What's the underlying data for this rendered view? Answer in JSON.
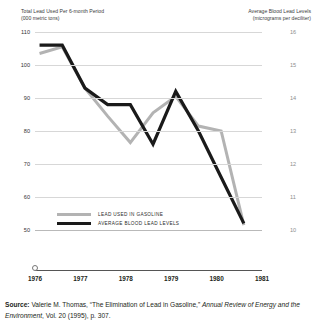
{
  "axis_titles": {
    "left": "Total Lead Used Per 6-month Period\n(000 metric tons)",
    "right": "Average Blood Lead Levels\n(micrograms per deciliter)"
  },
  "legend": {
    "gasoline": "LEAD USED IN GASOLINE",
    "blood": "AVERAGE BLOOD LEAD LEVELS"
  },
  "source": {
    "label": "Source:",
    "text_before": " Valerie M. Thomas, “The Elimination of Lead in Gasoline,” ",
    "italic": "Annual Review of Energy and the Environment",
    "text_after": ", Vol. 20 (1995), p. 307."
  },
  "colors": {
    "gasoline_line": "#b3b3b3",
    "blood_line": "#1a1a1a",
    "gridline": "#d7d7d7",
    "axis": "#555555"
  },
  "chart_data": {
    "type": "line",
    "title": "",
    "xlabel": "",
    "ylabel": "Total Lead Used Per 6-month Period (000 metric tons)",
    "y2label": "Average Blood Lead Levels (micrograms per deciliter)",
    "grid": true,
    "legend_position": "inside-bottom-left",
    "xlim": [
      1976,
      1981
    ],
    "ylim": [
      50,
      110
    ],
    "y2lim": [
      10,
      16
    ],
    "xticks": [
      "1976",
      "1977",
      "1978",
      "1979",
      "1980",
      "1981"
    ],
    "yticks": [
      110,
      100,
      90,
      80,
      70,
      60,
      50
    ],
    "y2ticks": [
      16,
      15,
      14,
      13,
      12,
      11,
      10
    ],
    "series": [
      {
        "name": "LEAD USED IN GASOLINE",
        "axis": "left",
        "color": "#b3b3b3",
        "x": [
          1976.1,
          1976.6,
          1977.1,
          1977.6,
          1978.1,
          1978.6,
          1979.1,
          1979.6,
          1980.1,
          1980.6
        ],
        "values": [
          103.5,
          105.5,
          93.0,
          84.5,
          76.5,
          85.5,
          90.5,
          81.5,
          80.0,
          51.5
        ]
      },
      {
        "name": "AVERAGE BLOOD LEAD LEVELS",
        "axis": "right",
        "color": "#1a1a1a",
        "x": [
          1976.1,
          1976.6,
          1977.1,
          1977.6,
          1978.1,
          1978.6,
          1979.1,
          1979.6,
          1980.1,
          1980.6
        ],
        "values": [
          15.6,
          15.6,
          14.3,
          13.8,
          13.8,
          12.6,
          14.2,
          13.0,
          11.6,
          10.2
        ]
      }
    ]
  }
}
